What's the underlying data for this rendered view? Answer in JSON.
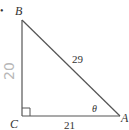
{
  "figure": {
    "type": "right-triangle",
    "bullet": "•",
    "vertices": {
      "A": {
        "label": "A",
        "x": 120,
        "y": 116
      },
      "B": {
        "label": "B",
        "x": 22,
        "y": 20
      },
      "C": {
        "label": "C",
        "x": 22,
        "y": 116
      }
    },
    "sides": {
      "hypotenuse_AB": "29",
      "base_CA": "21",
      "leg_BC_handwritten": "20"
    },
    "angle": {
      "symbol": "θ",
      "at": "A"
    },
    "right_angle_at": "C",
    "colors": {
      "line": "#555555",
      "text": "#333333",
      "handwriting": "#b8b8b8"
    }
  }
}
